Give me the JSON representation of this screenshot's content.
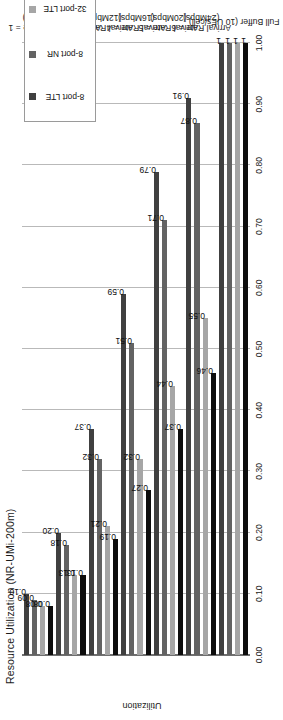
{
  "chart_data": {
    "type": "bar",
    "orientation": "horizontal-grouped",
    "title": "Resource Utilization (NR-UMi-200m)",
    "xlabel": "",
    "ylabel": "Utilization",
    "ylim": [
      0.0,
      1.0
    ],
    "ytick_labels": [
      "0.00",
      "0.10",
      "0.20",
      "0.30",
      "0.40",
      "0.50",
      "0.60",
      "0.70",
      "0.80",
      "0.90",
      "1.00"
    ],
    "ytick_values": [
      0.0,
      0.1,
      0.2,
      0.3,
      0.4,
      0.5,
      0.6,
      0.7,
      0.8,
      0.9,
      1.0
    ],
    "grid": true,
    "legend_position": "left-inside",
    "categories": [
      "Arrival Rate = 1\n(4Mbps)",
      "Arrival Rate = 2\n(8Mbps)",
      "Arrival Rate = 3\n(12Mbps)",
      "Arrival Rate = 4\n(16Mbps)",
      "Arrival Rate = 5\n(20Mbps)",
      "Arrival Rate = 6\n(24Mbps)",
      "Full Buffer (10 UEs/cell)"
    ],
    "category_lines": [
      [
        "Arrival Rate = 1",
        "(4Mbps)"
      ],
      [
        "Arrival Rate = 2",
        "(8Mbps)"
      ],
      [
        "Arrival Rate = 3",
        "(12Mbps)"
      ],
      [
        "Arrival Rate = 4",
        "(16Mbps)"
      ],
      [
        "Arrival Rate = 5",
        "(20Mbps)"
      ],
      [
        "Arrival Rate = 6",
        "(24Mbps)"
      ],
      [
        "Full Buffer (10 UEs/cell)"
      ]
    ],
    "series": [
      {
        "name": "8-port LTE",
        "color": "#404040",
        "values": [
          0.1,
          0.2,
          0.37,
          0.59,
          0.79,
          0.91,
          1.0
        ],
        "labels": [
          "0.10",
          "0.20",
          "0.37",
          "0.59",
          "0.79",
          "0.91",
          "1"
        ]
      },
      {
        "name": "8-port NR",
        "color": "#636363",
        "values": [
          0.09,
          0.18,
          0.32,
          0.51,
          0.71,
          0.87,
          1.0
        ],
        "labels": [
          "0.09",
          "0.18",
          "0.32",
          "0.51",
          "0.71",
          "0.87",
          "1"
        ]
      },
      {
        "name": "32-port LTE",
        "color": "#a6a6a6",
        "values": [
          0.08,
          0.13,
          0.21,
          0.32,
          0.44,
          0.55,
          1.0
        ],
        "labels": [
          "0.08",
          "0.13",
          "0.21",
          "0.32",
          "0.44",
          "0.55",
          "1"
        ]
      },
      {
        "name": "32-port NR",
        "color": "#0d0d0d",
        "values": [
          0.08,
          0.13,
          0.19,
          0.27,
          0.37,
          0.46,
          1.0
        ],
        "labels": [
          "0.08",
          "0.13",
          "0.19",
          "0.27",
          "0.37",
          "0.46",
          "1"
        ]
      }
    ]
  },
  "legend": {
    "items": [
      {
        "label": "8-port LTE",
        "color": "#404040"
      },
      {
        "label": "8-port NR",
        "color": "#636363"
      },
      {
        "label": "32-port LTE",
        "color": "#a6a6a6"
      },
      {
        "label": "32-port NR",
        "color": "#0d0d0d"
      }
    ]
  }
}
